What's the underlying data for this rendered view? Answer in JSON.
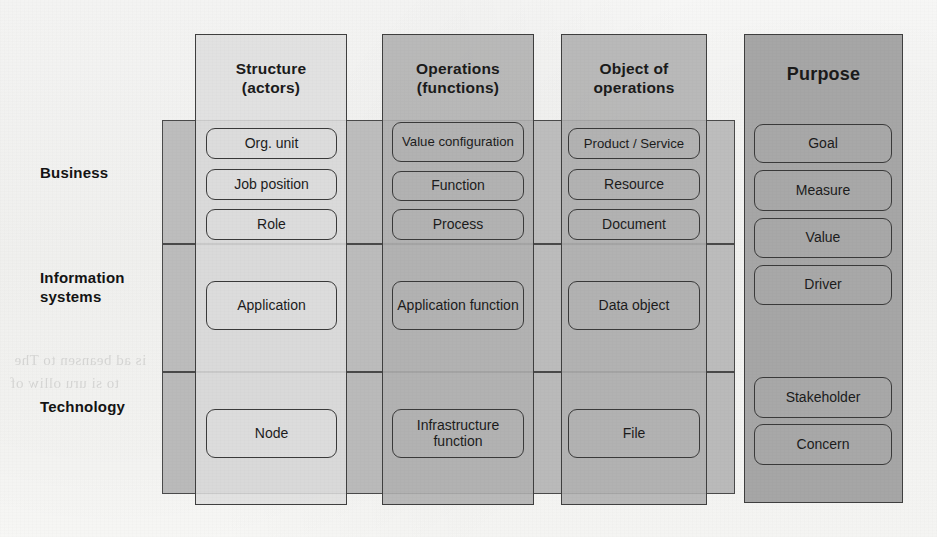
{
  "diagram": {
    "layers": [
      {
        "id": "business",
        "label": "Business"
      },
      {
        "id": "information",
        "label": "Information\nsystems",
        "line1": "Information",
        "line2": "systems"
      },
      {
        "id": "technology",
        "label": "Technology"
      }
    ],
    "columns": [
      {
        "id": "structure",
        "title_line1": "Structure",
        "title_line2": "(actors)",
        "shade": "light",
        "cells": {
          "business": [
            "Org. unit",
            "Job position",
            "Role"
          ],
          "information": [
            "Application"
          ],
          "technology": [
            "Node"
          ]
        }
      },
      {
        "id": "operations",
        "title_line1": "Operations",
        "title_line2": "(functions)",
        "shade": "mid",
        "cells": {
          "business": [
            "Value configuration",
            "Function",
            "Process"
          ],
          "information": [
            "Application function"
          ],
          "technology": [
            "Infrastructure function"
          ]
        }
      },
      {
        "id": "object-of-operations",
        "title_line1": "Object of",
        "title_line2": "operations",
        "shade": "mid",
        "cells": {
          "business": [
            "Product / Service",
            "Resource",
            "Document"
          ],
          "information": [
            "Data object"
          ],
          "technology": [
            "File"
          ]
        }
      },
      {
        "id": "purpose",
        "title_line1": "Purpose",
        "title_line2": "",
        "shade": "dark",
        "cells": {
          "all": [
            "Goal",
            "Measure",
            "Value",
            "Driver",
            "Stakeholder",
            "Concern"
          ]
        }
      }
    ],
    "colors": {
      "band": "#b9b9b9",
      "column_light": "#dedede",
      "column_mid": "#b0b0b0",
      "column_dark": "#a6a6a6",
      "outline": "#3a3a3a",
      "text": "#1c1c1c",
      "page": "#fbfbfa"
    }
  },
  "ghost_text": {
    "lines": [
      "is ad beansen to The",
      "to si  uru  olliw  of"
    ]
  }
}
